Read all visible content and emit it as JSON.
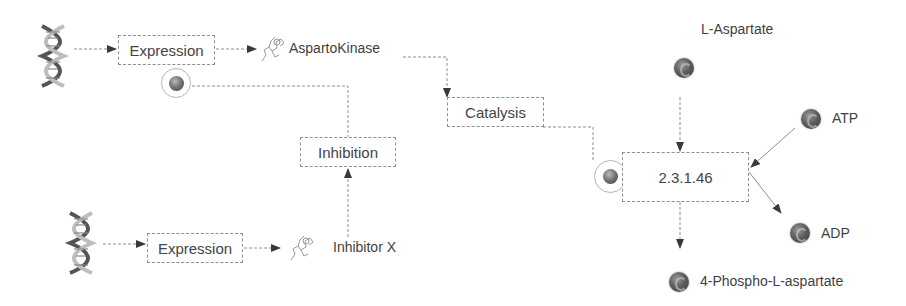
{
  "diagram": {
    "type": "pathway",
    "nodes": {
      "gene_top": {
        "icon": "dna-icon"
      },
      "gene_bottom": {
        "icon": "dna-icon"
      },
      "expression_top": {
        "label": "Expression"
      },
      "expression_bottom": {
        "label": "Expression"
      },
      "aspartokinase": {
        "label": "AspartoKinase",
        "icon": "protein-molecule-icon"
      },
      "inhibitor_x": {
        "label": "Inhibitor X",
        "icon": "protein-molecule-icon"
      },
      "inhibition": {
        "label": "Inhibition"
      },
      "catalysis": {
        "label": "Catalysis"
      },
      "reaction": {
        "label": "2.3.1.46"
      },
      "l_aspartate": {
        "label": "L-Aspartate",
        "icon": "compound-icon"
      },
      "atp": {
        "label": "ATP",
        "icon": "compound-icon"
      },
      "adp": {
        "label": "ADP",
        "icon": "compound-icon"
      },
      "phospho_aspartate": {
        "label": "4-Phospho-L-aspartate",
        "icon": "compound-icon"
      }
    },
    "edges": [
      {
        "from": "gene_top",
        "to": "expression_top"
      },
      {
        "from": "expression_top",
        "to": "aspartokinase"
      },
      {
        "from": "aspartokinase",
        "to": "catalysis"
      },
      {
        "from": "catalysis",
        "to": "reaction",
        "type": "modifier"
      },
      {
        "from": "gene_bottom",
        "to": "expression_bottom"
      },
      {
        "from": "expression_bottom",
        "to": "inhibitor_x"
      },
      {
        "from": "inhibitor_x",
        "to": "inhibition"
      },
      {
        "from": "inhibition",
        "to": "expression_top",
        "type": "modifier"
      },
      {
        "from": "l_aspartate",
        "to": "reaction"
      },
      {
        "from": "atp",
        "to": "reaction"
      },
      {
        "from": "reaction",
        "to": "adp"
      },
      {
        "from": "reaction",
        "to": "phospho_aspartate"
      }
    ],
    "colors": {
      "line": "#8e8e8e",
      "arrow": "#3a3a3a",
      "text": "#3f3f3f",
      "compound": "#5e5e5e"
    }
  }
}
